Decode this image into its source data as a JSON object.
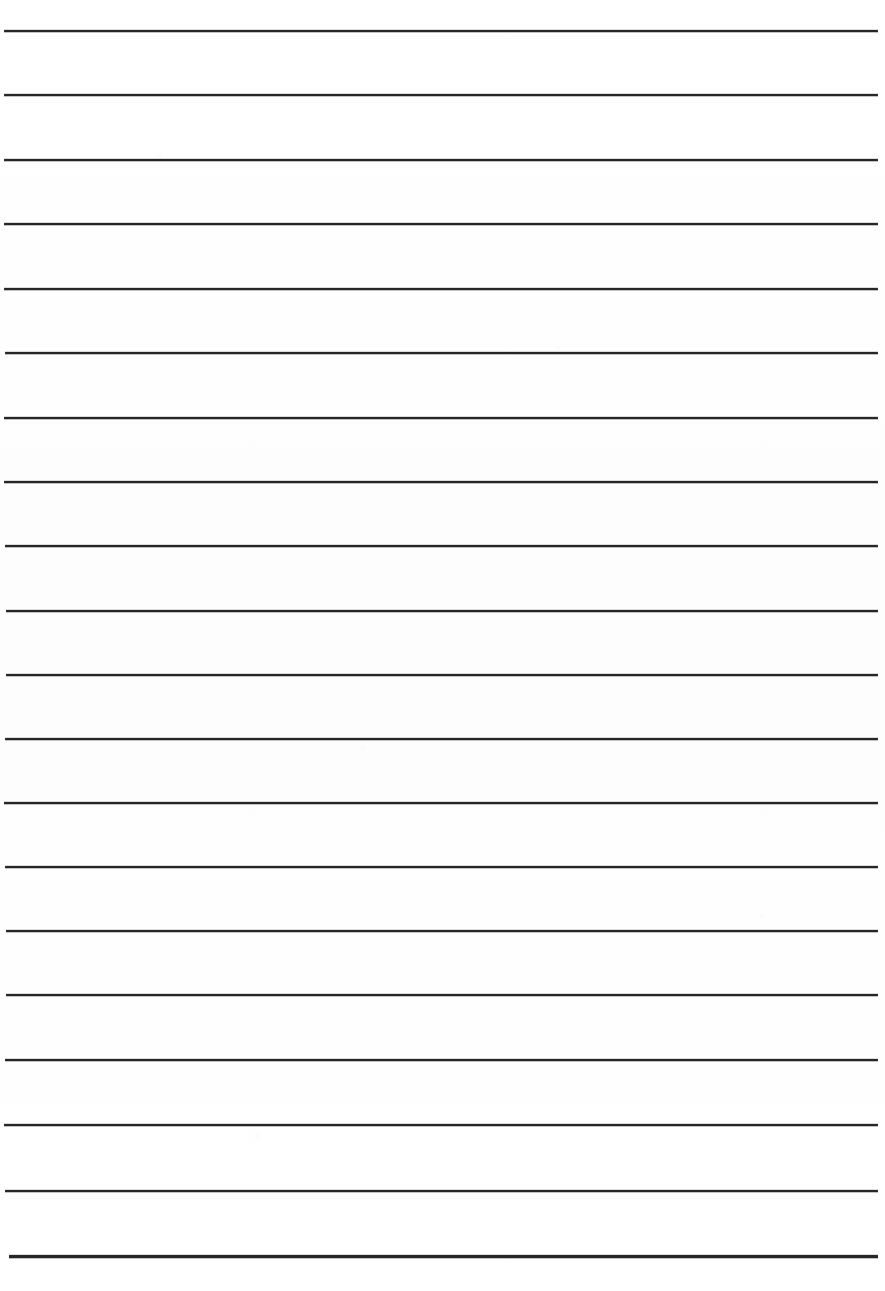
{
  "document": {
    "kind": "scanned-lined-paper",
    "title": "Blank Ruled Writing Paper",
    "description": "Scanned blank sheet of ruled notebook paper with horizontal writing lines and no written content",
    "page_width": 885,
    "page_height": 1291,
    "background_color": "#fefefe",
    "rule_color": "#262626",
    "rule_count": 20,
    "rule_thickness": 2,
    "rule_spacing": 64.5,
    "margin_left": 4,
    "margin_right": 878,
    "first_rule_y": 30,
    "last_rule_y": 1255,
    "has_text_content": false,
    "has_margin_rule": false,
    "has_header": false,
    "has_footer": false
  },
  "rules": [
    {
      "index": 1,
      "y": 30,
      "x_start": 4,
      "x_end": 878,
      "thickness": 2
    },
    {
      "index": 2,
      "y": 94,
      "x_start": 4,
      "x_end": 878,
      "thickness": 2
    },
    {
      "index": 3,
      "y": 159,
      "x_start": 4,
      "x_end": 878,
      "thickness": 2
    },
    {
      "index": 4,
      "y": 223,
      "x_start": 4,
      "x_end": 878,
      "thickness": 2
    },
    {
      "index": 5,
      "y": 288,
      "x_start": 4,
      "x_end": 878,
      "thickness": 2
    },
    {
      "index": 6,
      "y": 352,
      "x_start": 5,
      "x_end": 878,
      "thickness": 2
    },
    {
      "index": 7,
      "y": 417,
      "x_start": 4,
      "x_end": 878,
      "thickness": 2
    },
    {
      "index": 8,
      "y": 481,
      "x_start": 4,
      "x_end": 878,
      "thickness": 2
    },
    {
      "index": 9,
      "y": 545,
      "x_start": 5,
      "x_end": 878,
      "thickness": 2
    },
    {
      "index": 10,
      "y": 610,
      "x_start": 6,
      "x_end": 878,
      "thickness": 2
    },
    {
      "index": 11,
      "y": 674,
      "x_start": 6,
      "x_end": 878,
      "thickness": 2
    },
    {
      "index": 12,
      "y": 738,
      "x_start": 5,
      "x_end": 878,
      "thickness": 2
    },
    {
      "index": 13,
      "y": 802,
      "x_start": 4,
      "x_end": 878,
      "thickness": 2
    },
    {
      "index": 14,
      "y": 866,
      "x_start": 5,
      "x_end": 878,
      "thickness": 2
    },
    {
      "index": 15,
      "y": 930,
      "x_start": 6,
      "x_end": 878,
      "thickness": 2
    },
    {
      "index": 16,
      "y": 994,
      "x_start": 6,
      "x_end": 878,
      "thickness": 2
    },
    {
      "index": 17,
      "y": 1059,
      "x_start": 5,
      "x_end": 878,
      "thickness": 2
    },
    {
      "index": 18,
      "y": 1124,
      "x_start": 4,
      "x_end": 878,
      "thickness": 2
    },
    {
      "index": 19,
      "y": 1190,
      "x_start": 5,
      "x_end": 878,
      "thickness": 2
    },
    {
      "index": 20,
      "y": 1255,
      "x_start": 9,
      "x_end": 878,
      "thickness": 3
    }
  ]
}
